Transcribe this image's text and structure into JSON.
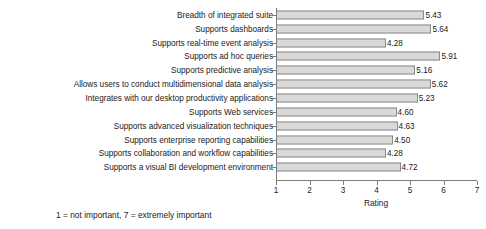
{
  "chart_data": {
    "type": "bar",
    "orientation": "horizontal",
    "title": "",
    "xlabel": "Rating",
    "ylabel": "",
    "xlim": [
      1,
      7
    ],
    "xticks": [
      "1",
      "2",
      "3",
      "4",
      "5",
      "6",
      "7"
    ],
    "grid": false,
    "legend": null,
    "categories": [
      "Breadth of integrated suite",
      "Supports dashboards",
      "Supports real-time event analysis",
      "Supports ad hoc queries",
      "Supports predictive analysis",
      "Allows users to conduct multidimensional data analysis",
      "Integrates with our desktop productivity applications",
      "Supports Web services",
      "Supports advanced visualization techniques",
      "Supports enterprise reporting capabilities",
      "Supports collaboration and workflow capabilities",
      "Supports a visual BI development environment"
    ],
    "values": [
      5.43,
      5.64,
      4.28,
      5.91,
      5.16,
      5.62,
      5.23,
      4.6,
      4.63,
      4.5,
      4.28,
      4.72
    ],
    "value_labels": [
      "5.43",
      "5.64",
      "4.28",
      "5.91",
      "5.16",
      "5.62",
      "5.23",
      "4.60",
      "4.63",
      "4.50",
      "4.28",
      "4.72"
    ],
    "annotation": "1 = not important, 7 = extremely important",
    "colors": {
      "bar_fill": "#d9d9d9",
      "bar_border": "#8a8a8a",
      "axis": "#7d7d7d",
      "text": "#1a1a1a",
      "background": "#ffffff"
    }
  }
}
